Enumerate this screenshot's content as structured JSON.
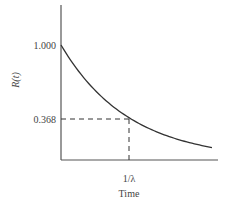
{
  "chart_data": {
    "type": "line",
    "title": "",
    "xlabel": "Time",
    "ylabel": "R(t)",
    "x_ticks": [
      "1/λ"
    ],
    "y_ticks": [
      "1.000",
      "0.368"
    ],
    "series": [
      {
        "name": "R(t) = e^(-λt)",
        "x": [
          0,
          0.5,
          1.0,
          1.5,
          2.0,
          2.3
        ],
        "values": [
          1.0,
          0.607,
          0.368,
          0.223,
          0.135,
          0.1
        ]
      }
    ],
    "annotations": [
      {
        "type": "dashed-line",
        "from": [
          0,
          0.368
        ],
        "to": [
          1.0,
          0.368
        ]
      },
      {
        "type": "dashed-line",
        "from": [
          1.0,
          0
        ],
        "to": [
          1.0,
          0.368
        ]
      }
    ],
    "grid": false,
    "legend": "none"
  },
  "labels": {
    "ylabel": "R(t)",
    "xlabel": "Time",
    "ytick_top": "1.000",
    "ytick_mid": "0.368",
    "xtick": "1/λ"
  }
}
